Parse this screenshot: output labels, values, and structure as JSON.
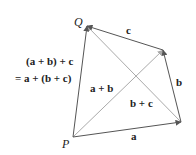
{
  "diagram": {
    "points": {
      "P": {
        "label": "P",
        "x": 73,
        "y": 137
      },
      "Q": {
        "label": "Q",
        "x": 87,
        "y": 26
      },
      "R": {
        "x": 163,
        "y": 50
      },
      "S": {
        "x": 181,
        "y": 122
      }
    },
    "vectors": [
      {
        "name": "a",
        "label": "a",
        "from": "P",
        "to": "S"
      },
      {
        "name": "b",
        "label": "b",
        "from": "S",
        "to": "R"
      },
      {
        "name": "c",
        "label": "c",
        "from": "R",
        "to": "Q"
      },
      {
        "name": "a+b",
        "label": "a + b",
        "from": "P",
        "to": "R"
      },
      {
        "name": "b+c",
        "label": "b + c",
        "from": "S",
        "to": "Q"
      },
      {
        "name": "sum",
        "label": "(a + b) + c",
        "from": "P",
        "to": "Q"
      }
    ],
    "labels": {
      "P": "P",
      "Q": "Q",
      "a": "a",
      "b": "b",
      "c": "c",
      "a_plus_b": "a + b",
      "b_plus_c": "b + c",
      "sum_line1": "(a + b) + c",
      "sum_line2": "= a + (b + c)"
    },
    "colors": {
      "dark_line": "#555555",
      "light_line": "#aaaaaa",
      "text": "#222222"
    }
  }
}
